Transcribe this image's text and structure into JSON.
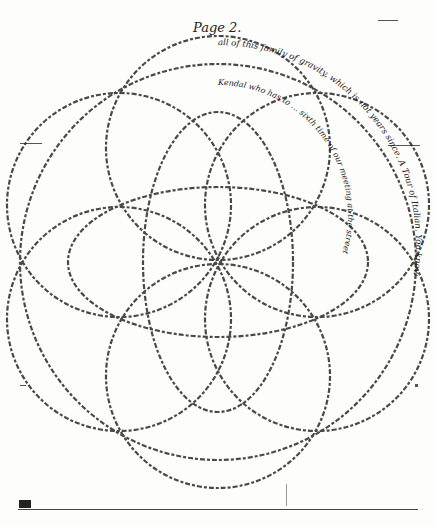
{
  "document": {
    "page_label": "Page 2.",
    "layout": "circular crossed handwriting (rosette of overlapping circles within a large circle)",
    "ink_color": "#1a1a1a",
    "paper_color": "#fdfdfb",
    "outer_circle_text": [
      "all of this family of gravity, which is not years since. A Tour of Italian. You know",
      "expressed from the Italian words, which they ... the ... in ... thus",
      "... they are being ... like a ... mutter me at Heretobe ... they have ... ",
      "... hope ... the ... grace ... hands of ... this"
    ],
    "inner_arcs_text": [
      "very ladylike - we acquired ... knowledge of ... the",
      "Thee Mile ... Two Miles ... the manner of",
      "Kendal who has to ... sixth time of our meeting at the street",
      "We heard in Lancashire ... fifth ... the house full",
      "We painted the house full ... Barrow, which ... the Island",
      "... happiness ... long at ... Some are ... ",
      "out ... Bashful ... the work of the ... hands",
      "... Berry ... to ask the ... street",
      "... Lane ... came ... at ... Barrow",
      "... in a ... manner ... Island with the ... ",
      "... They came ... have ... the ...",
      "... those words ... ingredient ... were"
    ]
  }
}
